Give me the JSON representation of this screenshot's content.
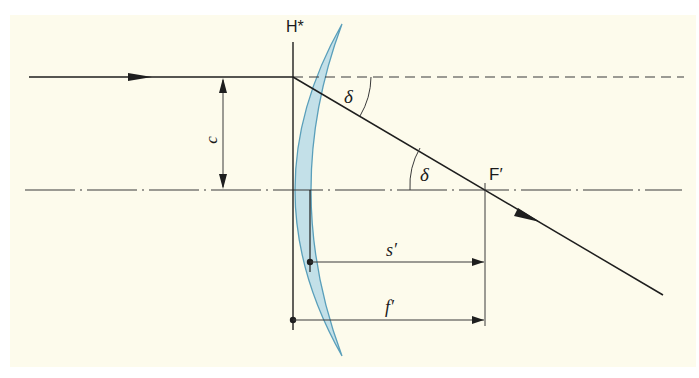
{
  "colors": {
    "background": "#fdfbec",
    "page": "#ffffff",
    "line": "#1e1e1e",
    "axis": "#3a3a3a",
    "lens_fill": "#b9dbe8",
    "lens_stroke": "#5a9fba"
  },
  "labels": {
    "principal_plane": "H*",
    "focal_point": "F′",
    "angle_top": "δ",
    "angle_bottom": "δ",
    "height": "c",
    "back_focal_distance": "s′",
    "focal_length": "f′"
  },
  "diagram": {
    "elements": [
      "incoming-ray",
      "dashed-continuation",
      "optical-axis",
      "refracted-ray",
      "meniscus-lens",
      "principal-plane-H*",
      "height-dimension-c",
      "angle-delta-top",
      "angle-delta-bottom",
      "focal-point-F′",
      "dimension-s′",
      "dimension-f′"
    ]
  }
}
